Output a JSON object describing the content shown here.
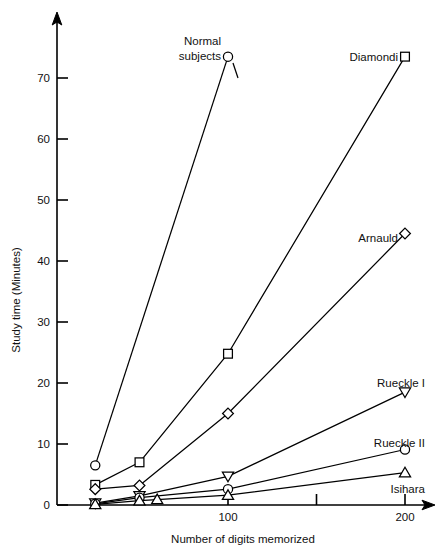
{
  "chart_data": {
    "type": "line",
    "title": "",
    "xlabel": "Number of digits memorized",
    "ylabel": "Study time (Minutes)",
    "xlim": [
      0,
      215
    ],
    "ylim": [
      0,
      75
    ],
    "grid": false,
    "legend_position": "inline-right-labels",
    "x_ticks": [
      {
        "value": 100,
        "label": "100"
      },
      {
        "value": 150,
        "label": ""
      },
      {
        "value": 200,
        "label": "200"
      }
    ],
    "y_ticks": [
      {
        "value": 0,
        "label": "0"
      },
      {
        "value": 10,
        "label": "10"
      },
      {
        "value": 20,
        "label": "20"
      },
      {
        "value": 30,
        "label": "30"
      },
      {
        "value": 40,
        "label": "40"
      },
      {
        "value": 50,
        "label": "50"
      },
      {
        "value": 60,
        "label": "60"
      },
      {
        "value": 70,
        "label": "70"
      }
    ],
    "series": [
      {
        "name": "Normal subjects",
        "marker": "circle",
        "x": [
          25,
          100
        ],
        "values": [
          6.5,
          73.5
        ],
        "label_text": "Normal\nsubjects",
        "label_line1": "Normal",
        "label_line2": "subjects"
      },
      {
        "name": "Diamondi",
        "marker": "square",
        "x": [
          25,
          50,
          100,
          200
        ],
        "values": [
          3.3,
          7.0,
          24.8,
          73.5
        ],
        "label_text": "Diamondi"
      },
      {
        "name": "Arnauld",
        "marker": "diamond",
        "x": [
          25,
          50,
          100,
          200
        ],
        "values": [
          2.6,
          3.2,
          15.0,
          44.5
        ],
        "label_text": "Arnauld"
      },
      {
        "name": "Rueckle I",
        "marker": "triangle-down",
        "x": [
          25,
          50,
          100,
          200
        ],
        "values": [
          0.3,
          1.5,
          4.7,
          18.5
        ],
        "label_text": "Rueckle I"
      },
      {
        "name": "Rueckle II",
        "marker": "circle",
        "x": [
          25,
          50,
          100,
          200
        ],
        "values": [
          0.2,
          1.2,
          2.6,
          9.1
        ],
        "label_text": "Rueckle II"
      },
      {
        "name": "Isihara",
        "marker": "triangle-up",
        "x": [
          25,
          50,
          60,
          100,
          200
        ],
        "values": [
          0.1,
          0.7,
          0.9,
          1.6,
          5.3
        ],
        "label_text": "Isihara"
      }
    ],
    "colors": {
      "axis": "#000000",
      "line": "#000000",
      "marker_fill": "#ffffff",
      "background": "#ffffff",
      "text": "#111111"
    }
  }
}
